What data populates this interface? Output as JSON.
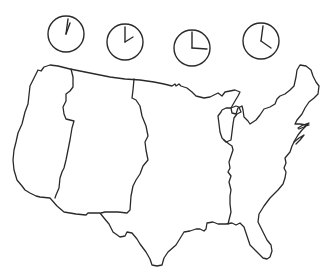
{
  "figure": {
    "title": "United States time zones",
    "caption": ""
  },
  "clocks": [
    {
      "zone": "Pacific",
      "time": "12:00",
      "hour": 12,
      "minute": 0,
      "cx": 66,
      "cy": 34
    },
    {
      "zone": "Mountain",
      "time": "1:00",
      "hour": 1,
      "minute": 0,
      "cx": 125,
      "cy": 42
    },
    {
      "zone": "Central",
      "time": "2:00",
      "hour": 2,
      "minute": 0,
      "cx": 192,
      "cy": 48
    },
    {
      "zone": "Eastern",
      "time": "3:00",
      "hour": 3,
      "minute": 0,
      "cx": 261,
      "cy": 41
    }
  ],
  "zones": [
    "Pacific",
    "Mountain",
    "Central",
    "Eastern"
  ],
  "colors": {
    "ink": "#2a2a2a",
    "background": "#ffffff"
  }
}
